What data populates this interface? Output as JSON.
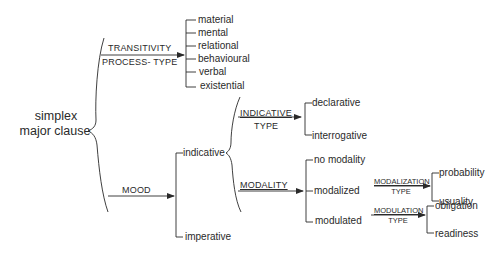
{
  "diagram": {
    "type": "system network",
    "root": {
      "line1": "simplex",
      "line2": "major clause"
    },
    "transitivity": {
      "label_top": "TRANSITIVITY",
      "label_bottom": "PROCESS- TYPE",
      "options": [
        "material",
        "mental",
        "relational",
        "behavioural",
        "verbal",
        "existential"
      ]
    },
    "mood": {
      "label": "MOOD",
      "options": [
        "indicative",
        "imperative"
      ]
    },
    "indicative_type": {
      "label_top": "INDICATIVE",
      "label_bottom": "TYPE",
      "options": [
        "declarative",
        "interrogative"
      ]
    },
    "modality": {
      "label": "MODALITY",
      "options": [
        "no modality",
        "modalized",
        "modulated"
      ]
    },
    "modalization_type": {
      "label_top": "MODALIZATION",
      "label_bottom": "TYPE",
      "options": [
        "probability",
        "usuality"
      ]
    },
    "modulation_type": {
      "label_top": "MODULATION",
      "label_bottom": "TYPE",
      "options": [
        "obligation",
        "readiness"
      ]
    },
    "colors": {
      "line": "#2a2a2a",
      "text": "#2a2a2a",
      "background": "#ffffff"
    }
  }
}
